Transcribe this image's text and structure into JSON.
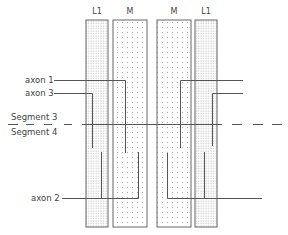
{
  "diagram": {
    "columns": [
      {
        "label": "L1",
        "side": "left",
        "pattern": "dense-dots"
      },
      {
        "label": "M",
        "side": "left",
        "pattern": "sparse-dots"
      },
      {
        "label": "M",
        "side": "right",
        "pattern": "sparse-dots"
      },
      {
        "label": "L1",
        "side": "right",
        "pattern": "dense-dots"
      }
    ],
    "labels": {
      "axon1": "axon 1",
      "axon3": "axon 3",
      "axon2": "axon 2",
      "segment3": "Segment 3",
      "segment4": "Segment 4"
    },
    "colors": {
      "line": "#555555",
      "border": "#666666",
      "dot": "#9a9a9a",
      "text": "#444444"
    }
  }
}
